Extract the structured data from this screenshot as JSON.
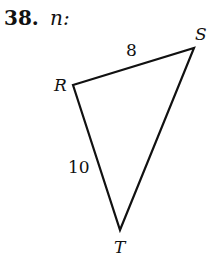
{
  "problem": {
    "number": "38.",
    "variable": "n:"
  },
  "triangle": {
    "vertices": [
      {
        "name": "R",
        "x": 73,
        "y": 85
      },
      {
        "name": "S",
        "x": 194,
        "y": 48
      },
      {
        "name": "T",
        "x": 120,
        "y": 230
      }
    ],
    "sides": [
      {
        "between": "RS",
        "length": "8"
      },
      {
        "between": "RT",
        "length": "10"
      }
    ],
    "stroke_color": "#111111"
  },
  "labels": {
    "R": "R",
    "S": "S",
    "T": "T",
    "side_RS": "8",
    "side_RT": "10"
  }
}
